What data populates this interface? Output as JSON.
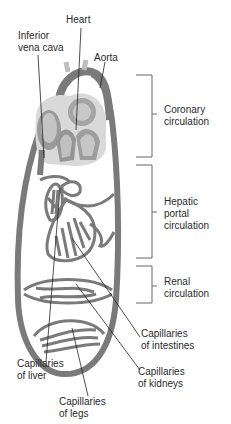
{
  "labels": {
    "heart": "Heart",
    "inferior_vena_cava": "Inferior\nvena cava",
    "aorta": "Aorta",
    "coronary": "Coronary\ncirculation",
    "hepatic": "Hepatic\nportal\ncirculation",
    "renal": "Renal\ncirculation",
    "cap_intestines": "Capillaries\nof intestines",
    "cap_liver": "Capillaries\nof liver",
    "cap_kidneys": "Capillaries\nof kidneys",
    "cap_legs": "Capillaries\nof legs"
  },
  "colors": {
    "vessel": "#7a7a7a",
    "vessel_light": "#a9a9a9",
    "heart_fill": "#b8b8b8",
    "heart_dark": "#8a8a8a",
    "pericardium": "#d9d9d9",
    "leader": "#222222",
    "bracket": "#666666"
  }
}
